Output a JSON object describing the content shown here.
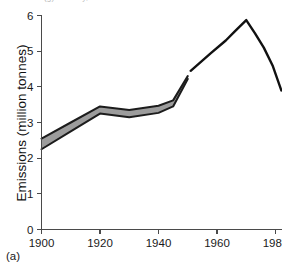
{
  "figure": {
    "panel_caption": "(a)",
    "top_clipped_text": "(g) industry, 1982",
    "axis_title_y": "Emissions (million tonnes)"
  },
  "chart_data": {
    "type": "line",
    "title": "",
    "subtitle": "",
    "xlabel": "",
    "ylabel": "Emissions (million tonnes)",
    "xlim": [
      1900,
      1982
    ],
    "ylim": [
      0,
      6
    ],
    "xticks": [
      1900,
      1920,
      1940,
      1960,
      1980
    ],
    "xticklabels": [
      "1900",
      "1920",
      "1940",
      "1960",
      "1980"
    ],
    "yticks": [
      0,
      1,
      2,
      3,
      4,
      5,
      6
    ],
    "yticklabels": [
      "0",
      "1",
      "2",
      "3",
      "4",
      "5",
      "6"
    ],
    "grid": false,
    "legend": null,
    "series": [
      {
        "name": "Estimated range (uncertainty band)",
        "type": "band",
        "style": "gray-filled-band-with-dark-edges",
        "fill_color": "#9c9c9c",
        "edge_color": "#1c1c1c",
        "x": [
          1900,
          1910,
          1920,
          1930,
          1940,
          1945,
          1950
        ],
        "upper": [
          2.55,
          3.0,
          3.45,
          3.35,
          3.47,
          3.62,
          4.3
        ],
        "lower": [
          2.25,
          2.75,
          3.25,
          3.15,
          3.27,
          3.45,
          4.22
        ]
      },
      {
        "name": "Emissions",
        "type": "line",
        "style": "solid-black-line",
        "color": "#111111",
        "x": [
          1951,
          1958,
          1963,
          1966,
          1970,
          1973,
          1976,
          1979,
          1982
        ],
        "values": [
          4.45,
          4.95,
          5.3,
          5.55,
          5.87,
          5.5,
          5.1,
          4.6,
          3.9
        ]
      }
    ],
    "annotations": [
      {
        "text": "(a)",
        "position": "bottom-left-outside-axes"
      }
    ]
  }
}
